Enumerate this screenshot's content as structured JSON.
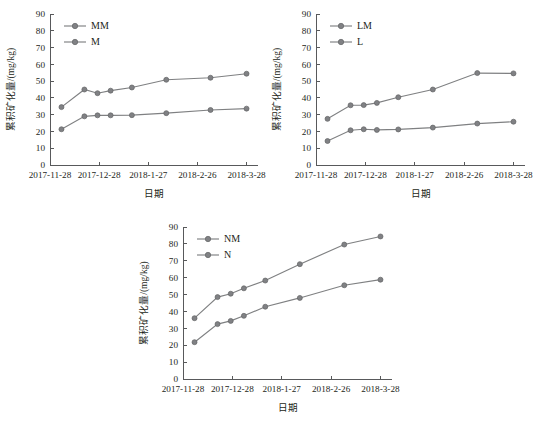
{
  "figure": {
    "panel_count": 3,
    "marker_color": "#808184",
    "line_color": "#7f8082",
    "axis_color": "#58595b",
    "background": "#ffffff"
  },
  "axis_common": {
    "ylabel": "累积矿化量/(mg/kg)",
    "xlabel": "日期",
    "yticks": [
      "0",
      "10",
      "20",
      "30",
      "40",
      "50",
      "60",
      "70",
      "80",
      "90"
    ],
    "xticks": [
      "2017-11-28",
      "2017-12-28",
      "2018-1-27",
      "2018-2-26",
      "2018-3-28"
    ]
  },
  "chart_data": [
    {
      "type": "line",
      "panel": "a",
      "title": "",
      "xlabel": "日期",
      "ylabel": "累积矿化量/(mg/kg)",
      "ylim": [
        0,
        90
      ],
      "ytick_step": 10,
      "grid": false,
      "legend_position": "top-left",
      "xtick_labels": [
        "2017-11-28",
        "2017-12-28",
        "2018-1-27",
        "2018-2-26",
        "2018-3-28"
      ],
      "x_days": [
        0,
        30,
        60,
        90,
        120
      ],
      "x": [
        7,
        21,
        29,
        37,
        50,
        71,
        98,
        120
      ],
      "series": [
        {
          "name": "MM",
          "values": [
            34.5,
            45.0,
            42.8,
            44.3,
            46.2,
            50.8,
            52.0,
            54.4
          ]
        },
        {
          "name": "M",
          "values": [
            21.3,
            29.0,
            29.6,
            29.6,
            29.7,
            30.9,
            32.8,
            33.6
          ]
        }
      ]
    },
    {
      "type": "line",
      "panel": "b",
      "title": "",
      "xlabel": "日期",
      "ylabel": "累积矿化量/(mg/kg)",
      "ylim": [
        0,
        90
      ],
      "ytick_step": 10,
      "grid": false,
      "legend_position": "top-left",
      "xtick_labels": [
        "2017-11-28",
        "2017-12-28",
        "2018-1-27",
        "2018-2-26",
        "2018-3-28"
      ],
      "x_days": [
        0,
        30,
        60,
        90,
        120
      ],
      "x": [
        7,
        21,
        29,
        37,
        50,
        71,
        98,
        120
      ],
      "series": [
        {
          "name": "LM",
          "values": [
            27.5,
            35.6,
            35.7,
            37.0,
            40.4,
            45.0,
            54.8,
            54.6
          ]
        },
        {
          "name": "L",
          "values": [
            14.3,
            20.7,
            21.3,
            20.9,
            21.2,
            22.3,
            24.7,
            25.8
          ]
        }
      ]
    },
    {
      "type": "line",
      "panel": "c",
      "title": "",
      "xlabel": "日期",
      "ylabel": "累积矿化量/(mg/kg)",
      "ylim": [
        0,
        90
      ],
      "ytick_step": 10,
      "grid": false,
      "legend_position": "top-left",
      "xtick_labels": [
        "2017-11-28",
        "2017-12-28",
        "2018-1-27",
        "2018-2-26",
        "2018-3-28"
      ],
      "x_days": [
        0,
        30,
        60,
        90,
        120
      ],
      "x": [
        7,
        21,
        29,
        37,
        50,
        71,
        98,
        120
      ],
      "series": [
        {
          "name": "NM",
          "values": [
            36.0,
            48.5,
            50.5,
            53.7,
            58.3,
            68.0,
            79.6,
            84.4
          ]
        },
        {
          "name": "N",
          "values": [
            21.8,
            32.5,
            34.4,
            37.4,
            42.8,
            48.0,
            55.5,
            58.8
          ]
        }
      ]
    }
  ]
}
